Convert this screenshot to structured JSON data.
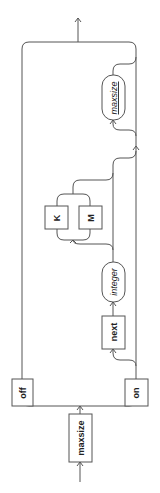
{
  "diagram": {
    "type": "railroad",
    "orientation": "rotated-90-ccw",
    "entry": {
      "label": "maxsize",
      "kind": "keyword"
    },
    "choice_1": [
      {
        "label": "off",
        "kind": "keyword"
      },
      {
        "label": "on",
        "kind": "keyword"
      }
    ],
    "on_branch": {
      "next": {
        "label": "next",
        "kind": "keyword"
      },
      "integer": {
        "label": "integer",
        "kind": "nonterminal"
      },
      "unit_choice": [
        {
          "label": "K",
          "kind": "keyword"
        },
        {
          "label": "M",
          "kind": "keyword"
        }
      ],
      "maxsize": {
        "label": "maxsize",
        "kind": "nonterminal"
      }
    }
  }
}
